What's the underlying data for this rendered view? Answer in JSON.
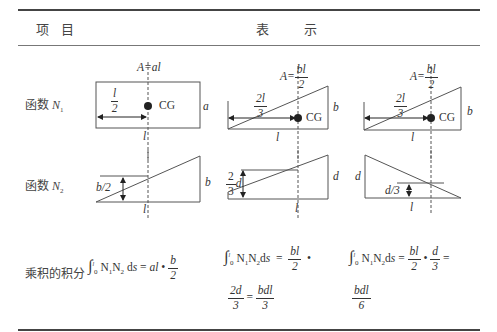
{
  "header": {
    "col1_char1": "项",
    "col1_char2": "目",
    "col2_char1": "表",
    "col2_char2": "示"
  },
  "rows": {
    "n1": {
      "label": "函数",
      "symbol": "N",
      "sub": "1"
    },
    "n2": {
      "label": "函数",
      "symbol": "N",
      "sub": "2"
    },
    "product": {
      "label": "乘积的积分"
    }
  },
  "diagrams": {
    "panel1": {
      "area_label": "A=al",
      "half_num": "l",
      "half_den": "2",
      "cg": "CG",
      "height": "a",
      "length": "l"
    },
    "panel2": {
      "area_prefix": "A=",
      "area_num": "bl",
      "area_den": "2",
      "dist_num": "2l",
      "dist_den": "3",
      "cg": "CG",
      "height": "b",
      "length": "l"
    },
    "panel3": {
      "area_prefix": "A=",
      "area_num": "bl",
      "area_den": "2",
      "dist_num": "2l",
      "dist_den": "3",
      "cg": "CG",
      "height": "b",
      "length": "l"
    },
    "n2_panel1": {
      "mid": "b/2",
      "height": "b",
      "length": "l"
    },
    "n2_panel2": {
      "frac_num": "2",
      "frac_den": "3",
      "frac_var": "d",
      "height": "d",
      "length": "l"
    },
    "n2_panel3": {
      "height": "d",
      "third": "d/3",
      "length": "l"
    }
  },
  "formulas": {
    "f1": {
      "integral": "∫",
      "upper": "l",
      "lower": "0",
      "expr": "N",
      "rest": "ds = al •",
      "num": "b",
      "den": "2"
    },
    "f2": {
      "integral": "∫",
      "upper": "l",
      "lower": "0",
      "eq": "=",
      "num1": "bl",
      "den1": "2",
      "dot": "•",
      "num2": "2d",
      "den2": "3",
      "eq2": "=",
      "num3": "bdl",
      "den3": "3"
    },
    "f3": {
      "integral": "∫",
      "upper": "l",
      "lower": "0",
      "eq": "=",
      "num1": "bl",
      "den1": "2",
      "dot": "•",
      "num2": "d",
      "den2": "3",
      "eq2": "=",
      "num3": "bdl",
      "den3": "6"
    }
  }
}
